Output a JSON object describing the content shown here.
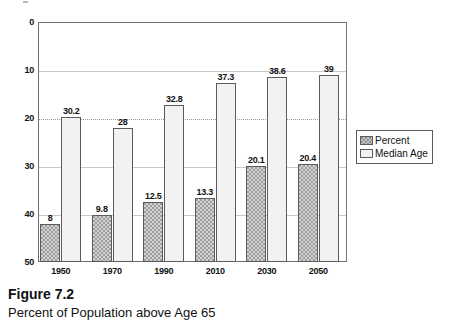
{
  "caption": {
    "figure_number": "Figure 7.2",
    "title": "Percent of Population above Age 65"
  },
  "legend": {
    "position": "right",
    "items": [
      {
        "label": "Percent",
        "color": "#9e9e9e",
        "pattern": "crosshatch"
      },
      {
        "label": "Median  Age",
        "color": "#f2f2f2",
        "pattern": "solid"
      }
    ]
  },
  "axes": {
    "y_ticks": [
      "50",
      "40",
      "30",
      "20",
      "10",
      "0"
    ],
    "x_ticks": [
      "1950",
      "1970",
      "1990",
      "2010",
      "2030",
      "2050"
    ]
  },
  "chart_data": {
    "type": "bar",
    "title": "Percent of Population above Age 65",
    "xlabel": "",
    "ylabel": "",
    "ylim": [
      0,
      50
    ],
    "ytick_values": [
      0,
      10,
      20,
      30,
      40,
      50
    ],
    "grid": true,
    "legend_position": "right",
    "categories": [
      "1950",
      "1970",
      "1990",
      "2010",
      "2030",
      "2050"
    ],
    "series": [
      {
        "name": "Percent",
        "color": "#9e9e9e",
        "values": [
          8,
          9.8,
          12.5,
          13.3,
          20.1,
          20.4
        ],
        "labels": [
          "8",
          "9.8",
          "12.5",
          "13.3",
          "20.1",
          "20.4"
        ]
      },
      {
        "name": "Median  Age",
        "color": "#f2f2f2",
        "values": [
          30.2,
          28,
          32.8,
          37.3,
          38.6,
          39
        ],
        "labels": [
          "30.2",
          "28",
          "32.8",
          "37.3",
          "38.6",
          "39"
        ]
      }
    ]
  }
}
